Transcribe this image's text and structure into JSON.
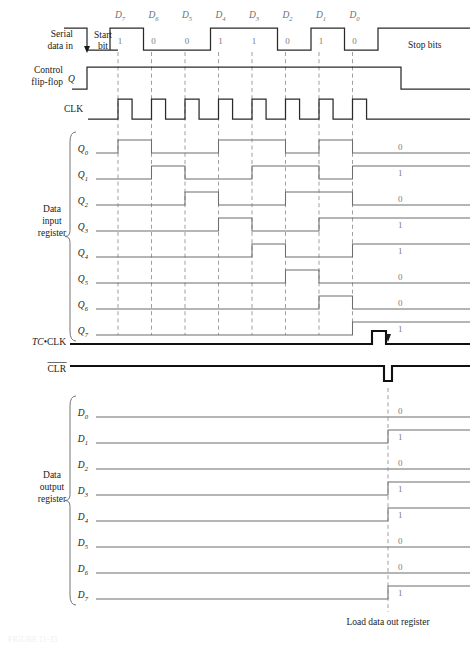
{
  "figure": {
    "caption": "FIGURE 11-33"
  },
  "colors": {
    "waveform_light": "#6d6d6d",
    "waveform_dark": "#2a2a2a",
    "waveform_bold": "#101010",
    "dashed_guide": "#8e8e8e",
    "bit_value_text": "#7c7c7c",
    "background": "#ffffff"
  },
  "geometry": {
    "width": 476,
    "height": 647,
    "wave_start_x": 110,
    "wave_end_x": 470,
    "bit_pitch": 33.5,
    "row_height": 26,
    "amplitude": 13
  },
  "bit_headers": {
    "labels": [
      "D7",
      "D6",
      "D5",
      "D4",
      "D3",
      "D2",
      "D1",
      "D0"
    ],
    "bases": [
      "D",
      "D",
      "D",
      "D",
      "D",
      "D",
      "D",
      "D"
    ],
    "subs": [
      "7",
      "6",
      "5",
      "4",
      "3",
      "2",
      "1",
      "0"
    ]
  },
  "serial_data_in": {
    "label_line1": "Serial",
    "label_line2": "data in",
    "start_bit_line1": "Start",
    "start_bit_line2": "bit",
    "stop_bits_label": "Stop bits",
    "bit_values": [
      "1",
      "0",
      "0",
      "1",
      "1",
      "0",
      "1",
      "0"
    ],
    "idle_before": "1",
    "start_bit_value": "0"
  },
  "control_flip_flop": {
    "label_line1": "Control",
    "label_line2": "flip-flop",
    "signal_name": "Q",
    "asserted_from": "start bit",
    "deasserted_at": "stop bits"
  },
  "clock": {
    "label": "CLK",
    "pulse_count": 8
  },
  "data_input_register": {
    "group_label_line1": "Data",
    "group_label_line2": "input",
    "group_label_line3": "register",
    "rows": [
      {
        "base": "Q",
        "sub": "0",
        "final_value": "0"
      },
      {
        "base": "Q",
        "sub": "1",
        "final_value": "1"
      },
      {
        "base": "Q",
        "sub": "2",
        "final_value": "0"
      },
      {
        "base": "Q",
        "sub": "3",
        "final_value": "1"
      },
      {
        "base": "Q",
        "sub": "4",
        "final_value": "1"
      },
      {
        "base": "Q",
        "sub": "5",
        "final_value": "0"
      },
      {
        "base": "Q",
        "sub": "6",
        "final_value": "0"
      },
      {
        "base": "Q",
        "sub": "7",
        "final_value": "1"
      }
    ]
  },
  "tc_clk": {
    "label_italic": "TC",
    "label_sep": "•",
    "label_rest": "CLK",
    "pulse_position": "after last clock edge"
  },
  "clr": {
    "label": "CLR",
    "overbar": true,
    "pulse_polarity": "negative"
  },
  "data_output_register": {
    "group_label_line1": "Data",
    "group_label_line2": "output",
    "group_label_line3": "register",
    "rows": [
      {
        "base": "D",
        "sub": "0",
        "final_value": "0"
      },
      {
        "base": "D",
        "sub": "1",
        "final_value": "1"
      },
      {
        "base": "D",
        "sub": "2",
        "final_value": "0"
      },
      {
        "base": "D",
        "sub": "3",
        "final_value": "1"
      },
      {
        "base": "D",
        "sub": "4",
        "final_value": "1"
      },
      {
        "base": "D",
        "sub": "5",
        "final_value": "0"
      },
      {
        "base": "D",
        "sub": "6",
        "final_value": "0"
      },
      {
        "base": "D",
        "sub": "7",
        "final_value": "1"
      }
    ]
  },
  "annotations": {
    "load_note": "Load data out register"
  },
  "chart_data": {
    "type": "timing",
    "xlabel": "time",
    "ylabel": "logic level",
    "bit_period_px": 33.5,
    "signals": [
      {
        "name": "Serial data in",
        "values": [
          "1",
          "0",
          "1",
          "0",
          "0",
          "1",
          "1",
          "0",
          "1",
          "0",
          "1"
        ],
        "segments": "idle-high, start bit low, D7=1, D6=0, D5=0, D4=1, D3=1, D2=0, D1=1, D0=0, stop bits high"
      },
      {
        "name": "Control flip-flop Q",
        "values": [
          "0",
          "1",
          "0"
        ]
      },
      {
        "name": "CLK",
        "values": [
          "0",
          "1",
          "0",
          "1",
          "0",
          "1",
          "0",
          "1",
          "0",
          "1",
          "0",
          "1",
          "0",
          "1",
          "0",
          "1",
          "0"
        ]
      },
      {
        "name": "Q0",
        "values": [
          "0",
          "1",
          "0",
          "1",
          "0",
          "1",
          "0"
        ],
        "final": "0"
      },
      {
        "name": "Q1",
        "values": [
          "0",
          "1",
          "0",
          "1",
          "0",
          "1",
          "0"
        ],
        "final": "1"
      },
      {
        "name": "Q2",
        "values": [
          "0",
          "1",
          "0",
          "1",
          "0"
        ],
        "final": "0"
      },
      {
        "name": "Q3",
        "values": [
          "0",
          "1",
          "0",
          "1"
        ],
        "final": "1"
      },
      {
        "name": "Q4",
        "values": [
          "0",
          "1",
          "0",
          "1"
        ],
        "final": "1"
      },
      {
        "name": "Q5",
        "values": [
          "0",
          "1",
          "0"
        ],
        "final": "0"
      },
      {
        "name": "Q6",
        "values": [
          "0",
          "1",
          "0"
        ],
        "final": "0"
      },
      {
        "name": "Q7",
        "values": [
          "0",
          "1"
        ],
        "final": "1"
      },
      {
        "name": "TC•CLK",
        "values": [
          "0",
          "1",
          "0"
        ]
      },
      {
        "name": "CLR",
        "values": [
          "1",
          "0",
          "1"
        ]
      },
      {
        "name": "D0",
        "values": [
          "0"
        ],
        "final": "0"
      },
      {
        "name": "D1",
        "values": [
          "0",
          "1"
        ],
        "final": "1"
      },
      {
        "name": "D2",
        "values": [
          "0"
        ],
        "final": "0"
      },
      {
        "name": "D3",
        "values": [
          "0",
          "1"
        ],
        "final": "1"
      },
      {
        "name": "D4",
        "values": [
          "0",
          "1"
        ],
        "final": "1"
      },
      {
        "name": "D5",
        "values": [
          "0"
        ],
        "final": "0"
      },
      {
        "name": "D6",
        "values": [
          "0"
        ],
        "final": "0"
      },
      {
        "name": "D7",
        "values": [
          "0",
          "1"
        ],
        "final": "1"
      }
    ]
  }
}
